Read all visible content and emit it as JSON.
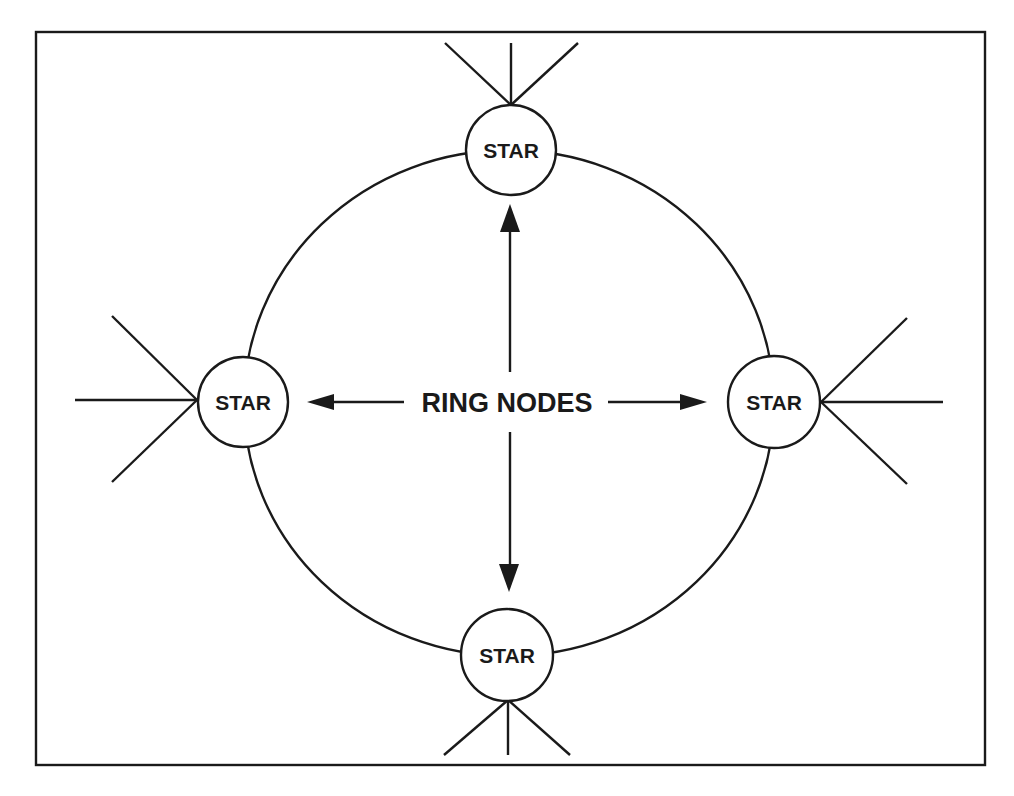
{
  "figure": {
    "type": "ring-of-stars topology",
    "center_label": "RING NODES",
    "nodes": [
      {
        "id": "top",
        "label": "STAR"
      },
      {
        "id": "left",
        "label": "STAR"
      },
      {
        "id": "right",
        "label": "STAR"
      },
      {
        "id": "bottom",
        "label": "STAR"
      }
    ],
    "spokes_per_node": 3,
    "arrows": [
      "up",
      "down",
      "left",
      "right"
    ]
  },
  "colors": {
    "line": "#1a1a1a",
    "background": "#ffffff"
  }
}
